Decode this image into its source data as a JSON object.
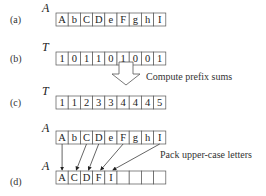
{
  "rows": [
    {
      "id": "a",
      "label": "(a)",
      "var": "A",
      "cells": [
        "A",
        "b",
        "C",
        "D",
        "e",
        "F",
        "g",
        "h",
        "I"
      ]
    },
    {
      "id": "b",
      "label": "(b)",
      "var": "T",
      "cells": [
        "1",
        "0",
        "1",
        "1",
        "0",
        "1",
        "0",
        "0",
        "1"
      ]
    },
    {
      "id": "c",
      "label": "(c)",
      "var": "T",
      "cells": [
        "1",
        "1",
        "2",
        "3",
        "3",
        "4",
        "4",
        "4",
        "5"
      ]
    },
    {
      "id": "src",
      "label": "",
      "var": "A",
      "cells": [
        "A",
        "b",
        "C",
        "D",
        "e",
        "F",
        "g",
        "h",
        "I"
      ]
    },
    {
      "id": "d",
      "label": "(d)",
      "var": "A",
      "cells": [
        "A",
        "C",
        "D",
        "F",
        "I",
        "",
        "",
        "",
        ""
      ]
    }
  ],
  "step_label": "Compute prefix sums",
  "pack_label": "Pack upper-case letters",
  "pack_mapping": [
    {
      "from": 0,
      "to": 0
    },
    {
      "from": 2,
      "to": 1
    },
    {
      "from": 3,
      "to": 2
    },
    {
      "from": 5,
      "to": 3
    },
    {
      "from": 8,
      "to": 4
    }
  ]
}
